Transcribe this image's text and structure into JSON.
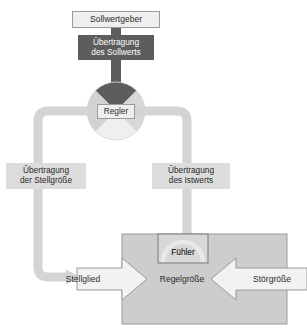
{
  "diagram": {
    "language": "de",
    "type": "control-loop-block-diagram",
    "colors": {
      "background": "#ffffff",
      "pipe": "#d4d4d4",
      "pipe_dark": "#5d5d5d",
      "box_light_fill": "#efefef",
      "box_light_stroke": "#9a9a9a",
      "box_dark_fill": "#5d5d5d",
      "plate_fill": "#dcdcdc",
      "plant_fill": "#cdcdcd",
      "plant_stroke": "#9a9a9a",
      "circle_light": "#e4e4e4",
      "circle_mid": "#d2d2d2",
      "circle_dark": "#5d5d5d",
      "arrow_fill": "#f2f2f2",
      "arrow_stroke": "#9a9a9a",
      "text": "#2b2b2b",
      "text_inverse": "#ffffff"
    },
    "nodes": {
      "sollwertgeber": "Sollwertgeber",
      "uebertragung_sollwert": "Übertragung\ndes Sollwerts",
      "regler": "Regler",
      "uebertragung_stellgroesse": "Übertragung\nder Stellgröße",
      "uebertragung_istwert": "Übertragung\ndes Istwerts",
      "stellglied": "Stellglied",
      "regelgroesse": "Regelgröße",
      "stoergroesse": "Störgröße",
      "fuehler": "Fühler"
    }
  }
}
